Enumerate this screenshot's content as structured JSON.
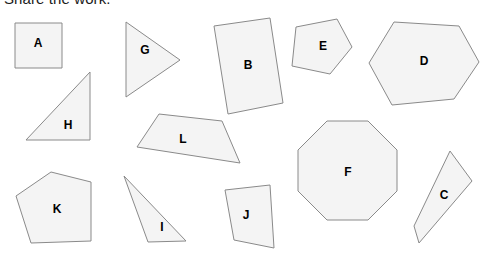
{
  "heading": "Share the work.",
  "canvas": {
    "width": 485,
    "height": 255,
    "background": "#ffffff"
  },
  "style": {
    "shape_fill": "#f4f4f4",
    "shape_stroke": "#8a8a8a",
    "label_color": "#000000",
    "heading_color": "#1a1a1a"
  },
  "shapes": [
    {
      "label": "A",
      "kind": "square",
      "points": "15,23 62,23 62,68 15,68",
      "label_x": 38,
      "label_y": 44
    },
    {
      "label": "G",
      "kind": "triangle",
      "points": "126,22 126,97 180,60",
      "label_x": 145,
      "label_y": 51
    },
    {
      "label": "B",
      "kind": "rectangle-rotated",
      "points": "214,26 270,18 283,103 228,114",
      "label_x": 248,
      "label_y": 66
    },
    {
      "label": "E",
      "kind": "pentagon",
      "points": "296,27 337,19 352,47 330,74 292,66",
      "label_x": 323,
      "label_y": 47
    },
    {
      "label": "D",
      "kind": "hexagon",
      "points": "394,22 459,26 479,62 454,99 392,105 369,63",
      "label_x": 424,
      "label_y": 62
    },
    {
      "label": "H",
      "kind": "right-triangle",
      "points": "90,72 90,140 26,140",
      "label_x": 68,
      "label_y": 126
    },
    {
      "label": "L",
      "kind": "parallelogram",
      "points": "159,114 222,121 240,163 137,147",
      "label_x": 183,
      "label_y": 140
    },
    {
      "label": "F",
      "kind": "octagon",
      "points": "327,121 368,121 397,150 397,191 368,220 327,220 298,191 298,150",
      "label_x": 348,
      "label_y": 173
    },
    {
      "label": "K",
      "kind": "pentagon",
      "points": "51,172 91,182 91,241 31,243 16,196",
      "label_x": 57,
      "label_y": 210
    },
    {
      "label": "I",
      "kind": "triangle",
      "points": "124,176 186,241 148,242",
      "label_x": 162,
      "label_y": 228
    },
    {
      "label": "J",
      "kind": "quadrilateral",
      "points": "225,190 270,185 274,248 234,240",
      "label_x": 246,
      "label_y": 216
    },
    {
      "label": "C",
      "kind": "quadrilateral",
      "points": "450,151 472,181 419,243 414,226",
      "label_x": 444,
      "label_y": 196
    }
  ]
}
